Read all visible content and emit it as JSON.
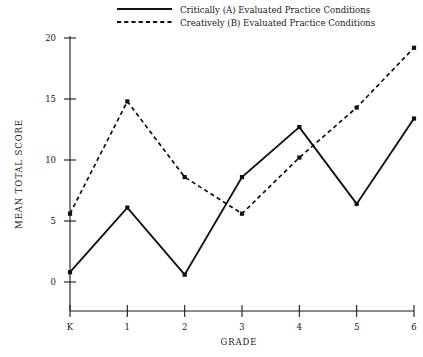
{
  "chart_data": {
    "type": "line",
    "title": "",
    "xlabel": "GRADE",
    "ylabel": "MEAN TOTAL SCORE",
    "categories": [
      "K",
      "1",
      "2",
      "3",
      "4",
      "5",
      "6"
    ],
    "xtick_labels": [
      "K",
      "1",
      "2",
      "3",
      "4",
      "5",
      "6"
    ],
    "ytick_labels": [
      "0",
      "5",
      "10",
      "15",
      "20"
    ],
    "yticks": [
      0,
      5,
      10,
      15,
      20
    ],
    "ylim": [
      -2,
      21
    ],
    "xlim": [
      -0.35,
      6.35
    ],
    "grid": false,
    "legend_position": "top-center",
    "series": [
      {
        "name": "Critically (A) Evaluated Practice Conditions",
        "style": "solid",
        "marker": "filled-square",
        "color": "#111111",
        "values": [
          0.8,
          6.1,
          0.6,
          8.6,
          12.7,
          6.4,
          13.4
        ]
      },
      {
        "name": "Creatively (B) Evaluated Practice Conditions",
        "style": "dashed",
        "marker": "filled-square",
        "color": "#111111",
        "values": [
          5.6,
          14.8,
          8.6,
          5.6,
          10.2,
          14.3,
          19.2
        ]
      }
    ]
  },
  "legend": {
    "items": [
      {
        "label": "Critically (A) Evaluated Practice Conditions",
        "style": "solid"
      },
      {
        "label": "Creatively (B) Evaluated Practice Conditions",
        "style": "dashed"
      }
    ]
  },
  "axes": {
    "x_title": "GRADE",
    "y_title": "MEAN TOTAL SCORE"
  }
}
